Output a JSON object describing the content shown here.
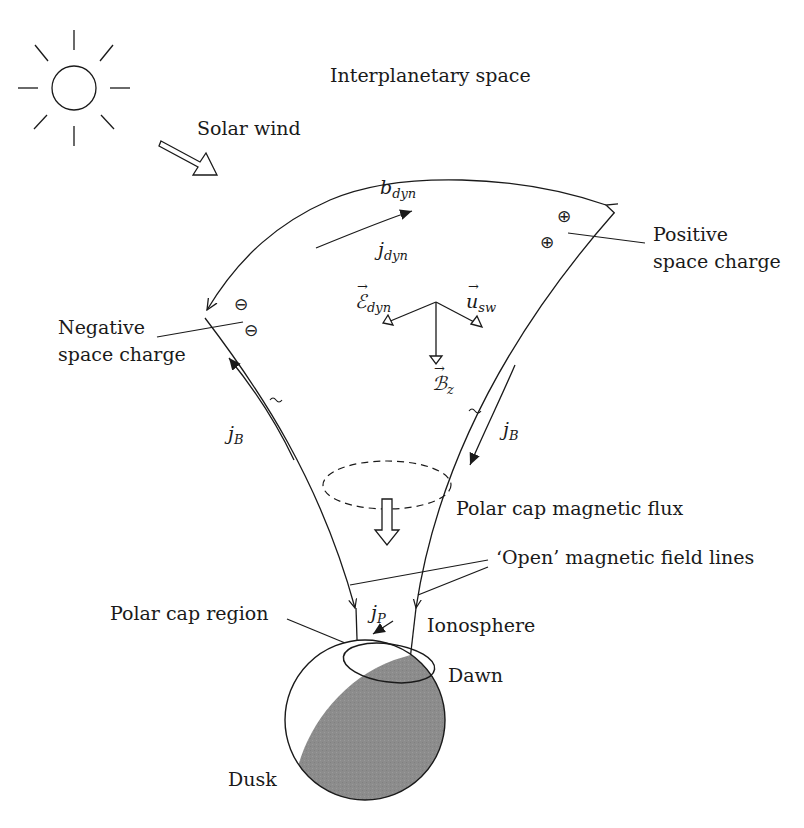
{
  "diagram": {
    "type": "physics-schematic",
    "regions": {
      "interplanetary_space": "Interplanetary space",
      "solar_wind": "Solar wind",
      "polar_cap_flux": "Polar cap magnetic flux",
      "open_field_lines": "‘Open’ magnetic field lines",
      "polar_cap_region": "Polar cap region",
      "ionosphere": "Ionosphere",
      "dawn": "Dawn",
      "dusk": "Dusk"
    },
    "charges": {
      "positive": {
        "line1": "Positive",
        "line2": "space charge",
        "symbol": "⊕"
      },
      "negative": {
        "line1": "Negative",
        "line2": "space charge",
        "symbol": "⊖"
      }
    },
    "symbols": {
      "b_dyn": {
        "base": "b",
        "sub": "dyn"
      },
      "j_dyn": {
        "base": "j",
        "sub": "dyn"
      },
      "E_dyn": {
        "base": "ℰ",
        "sub": "dyn"
      },
      "u_sw": {
        "base": "u",
        "sub": "sw"
      },
      "B_z": {
        "base": "ℬ",
        "sub": "z"
      },
      "j_B_left": {
        "base": "j",
        "sub": "B"
      },
      "j_B_right": {
        "base": "j",
        "sub": "B"
      },
      "j_P": {
        "base": "j",
        "sub": "P"
      }
    },
    "icons": [
      "sun-icon",
      "solar-wind-arrow-icon",
      "flux-arrow-icon",
      "earth-icon"
    ],
    "colors": {
      "ink": "#1a1a1a",
      "nightside_shade": "#8c8c8c",
      "background": "#ffffff"
    }
  }
}
